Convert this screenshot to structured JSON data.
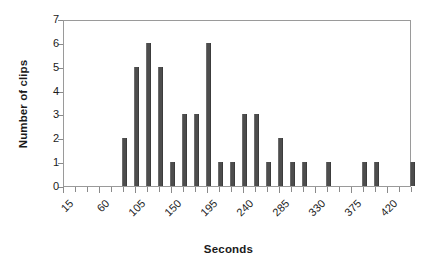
{
  "chart_data": {
    "type": "bar",
    "title": "",
    "xlabel": "Seconds",
    "ylabel": "Number of clips",
    "ylim": [
      0,
      7
    ],
    "yticks": [
      0,
      1,
      2,
      3,
      4,
      5,
      6,
      7
    ],
    "xlim": [
      15,
      450
    ],
    "xticks": [
      15,
      30,
      45,
      60,
      75,
      90,
      105,
      120,
      135,
      150,
      165,
      180,
      195,
      210,
      225,
      240,
      255,
      270,
      285,
      300,
      315,
      330,
      345,
      360,
      375,
      390,
      405,
      420,
      435,
      450
    ],
    "xtick_labels": [
      "15",
      "60",
      "105",
      "150",
      "195",
      "240",
      "285",
      "330",
      "375",
      "420"
    ],
    "xtick_labeled_values": [
      15,
      60,
      105,
      150,
      195,
      240,
      285,
      330,
      375,
      420
    ],
    "bin_width": 15,
    "grid": false,
    "legend": false,
    "bar_color": "#4d4d4d",
    "categories": [
      15,
      30,
      45,
      60,
      75,
      90,
      105,
      120,
      135,
      150,
      165,
      180,
      195,
      210,
      225,
      240,
      255,
      270,
      285,
      300,
      315,
      330,
      345,
      360,
      375,
      390,
      405,
      420,
      435,
      450
    ],
    "values": [
      0,
      0,
      0,
      0,
      0,
      2,
      5,
      6,
      5,
      1,
      3,
      3,
      6,
      1,
      1,
      3,
      3,
      1,
      2,
      1,
      1,
      0,
      1,
      0,
      0,
      1,
      1,
      0,
      0,
      1
    ]
  }
}
